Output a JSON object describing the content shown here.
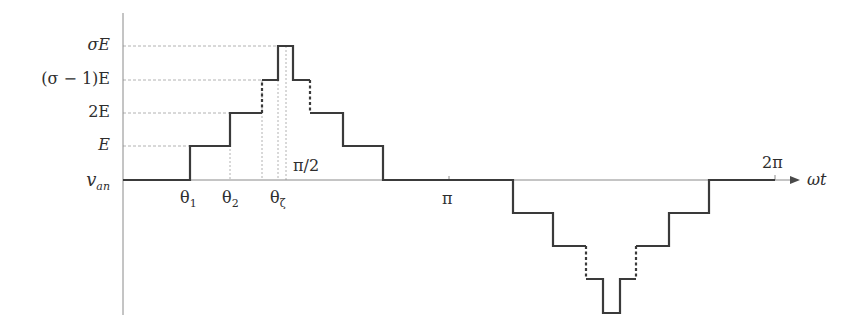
{
  "figure": {
    "title": "",
    "axis": {
      "x_label": "ωt",
      "x_ticks": [
        {
          "label": "θ1",
          "base": "θ",
          "sub": "1"
        },
        {
          "label": "θ2",
          "base": "θ",
          "sub": "2"
        },
        {
          "label": "θζ",
          "base": "θ",
          "sub": "ζ"
        },
        {
          "label": "π/2"
        },
        {
          "label": "π"
        },
        {
          "label": "2π"
        }
      ],
      "y_ticks": [
        {
          "label": "v_an",
          "base": "v",
          "sub": "an"
        },
        {
          "label": "E"
        },
        {
          "label": "2E"
        },
        {
          "label": "(σ − 1)E"
        },
        {
          "label": "σE"
        }
      ]
    },
    "waveform": {
      "description": "Multilevel staircase output voltage waveform v_an over one period 0 to 2π",
      "positive_half_levels": [
        "0",
        "E",
        "2E",
        "(σ − 1)E",
        "σE",
        "(σ − 1)E",
        "2E",
        "E",
        "0"
      ],
      "negative_half_levels": [
        "0",
        "−E",
        "−2E",
        "−(σ − 1)E",
        "−σE",
        "−(σ − 1)E",
        "−2E",
        "−E",
        "0"
      ],
      "colors": {
        "waveform": "#3a3a3a",
        "axis": "#8a8a8a",
        "guides": "#9a9a9a"
      }
    }
  }
}
